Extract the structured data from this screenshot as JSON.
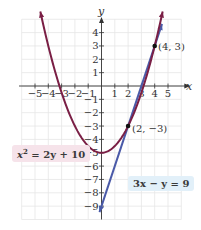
{
  "chart_data": {
    "type": "line",
    "title": "",
    "xlabel": "x",
    "ylabel": "y",
    "xlim": [
      -6,
      6
    ],
    "ylim": [
      -10,
      5
    ],
    "grid": true,
    "x_ticks": [
      -5,
      -4,
      -3,
      -2,
      -1,
      1,
      2,
      3,
      4,
      5
    ],
    "x_tick_labels": [
      "−5",
      "−4",
      "−3",
      "−2",
      "−1",
      "1",
      "2",
      "3",
      "4",
      "5"
    ],
    "y_ticks": [
      4,
      3,
      2,
      1,
      -1,
      -2,
      -3,
      -4,
      -5,
      -6,
      -7,
      -8,
      -9
    ],
    "y_tick_labels": [
      "4",
      "3",
      "2",
      "1",
      "−1",
      "−2",
      "−3",
      "−4",
      "−5",
      "−6",
      "−7",
      "−8",
      "−9"
    ],
    "series": [
      {
        "name": "x² = 2y + 10",
        "kind": "parabola",
        "equation": "y = x²/2 − 5",
        "color": "#7a1f45",
        "x_range": [
          -4.6,
          4.6
        ],
        "vertex": [
          0,
          -5
        ]
      },
      {
        "name": "3x − y = 9",
        "kind": "line",
        "equation": "y = 3x − 9",
        "color": "#4a5aa8",
        "x_range": [
          -0.15,
          4.55
        ]
      }
    ],
    "points": [
      {
        "x": 4,
        "y": 3,
        "label": "(4, 3)"
      },
      {
        "x": 2,
        "y": -3,
        "label": "(2, −3)"
      }
    ],
    "annotations": [
      {
        "text": "x² = 2y + 10",
        "color": "#f6e3ea"
      },
      {
        "text": "3x − y = 9",
        "color": "#e2f0f9"
      }
    ]
  },
  "labels": {
    "x_axis": "x",
    "y_axis": "y",
    "eq_parabola_pre": "x",
    "eq_parabola_sup": "2",
    "eq_parabola_post": " = 2y + 10",
    "eq_line": "3x − y = 9",
    "pt1": "(4, 3)",
    "pt2": "(2, −3)"
  }
}
